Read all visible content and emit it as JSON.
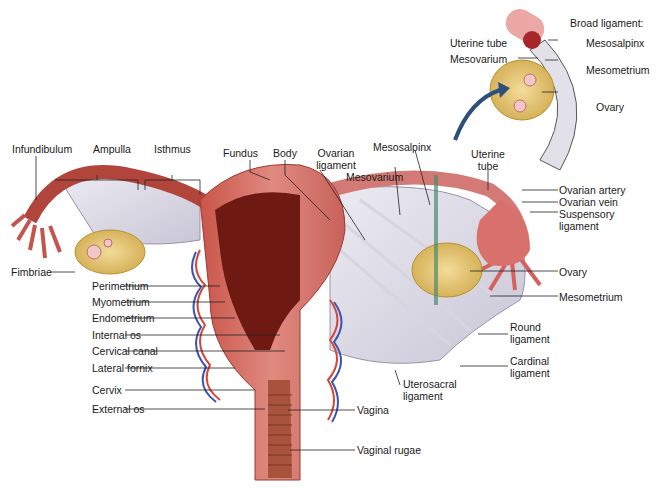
{
  "figure": {
    "inset": {
      "title": "Broad ligament:",
      "labels": [
        "Uterine tube",
        "Mesovarium",
        "Mesosalpinx",
        "Mesometrium",
        "Ovary"
      ]
    },
    "top_labels": {
      "infundibulum": "Infundibulum",
      "ampulla": "Ampulla",
      "isthmus": "Isthmus",
      "fundus": "Fundus",
      "body": "Body",
      "ovarian_ligament_1": "Ovarian",
      "ovarian_ligament_2": "ligament",
      "mesosalpinx": "Mesosalpinx",
      "mesovarium": "Mesovarium",
      "uterine_tube_1": "Uterine",
      "uterine_tube_2": "tube"
    },
    "left_labels": {
      "fimbriae": "Fimbriae",
      "perimetrium": "Perimetrium",
      "myometrium": "Myometrium",
      "endometrium": "Endometrium",
      "internal_os": "Internal os",
      "cervical_canal": "Cervical canal",
      "lateral_fornix": "Lateral fornix",
      "cervix": "Cervix",
      "external_os": "External os"
    },
    "right_labels": {
      "ovarian_artery": "Ovarian artery",
      "ovarian_vein": "Ovarian vein",
      "suspensory_1": "Suspensory",
      "suspensory_2": "ligament",
      "ovary": "Ovary",
      "mesometrium": "Mesometrium",
      "round_1": "Round",
      "round_2": "ligament",
      "cardinal_1": "Cardinal",
      "cardinal_2": "ligament",
      "uterosacral_1": "Uterosacral",
      "uterosacral_2": "ligament",
      "vagina": "Vagina",
      "vaginal_rugae": "Vaginal rugae"
    }
  }
}
